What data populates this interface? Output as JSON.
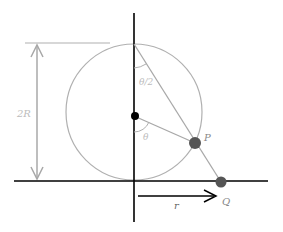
{
  "diagram": {
    "labels": {
      "height": "2R",
      "half_angle": "θ/2",
      "angle": "θ",
      "point_p": "P",
      "point_q": "Q",
      "distance": "r"
    },
    "colors": {
      "axis": "#000000",
      "circle": "#b0b0b0",
      "line": "#a8a8a8",
      "point": "#555555",
      "center": "#000000",
      "label_gray": "#b5b5b5",
      "label_dark": "#777777"
    }
  }
}
